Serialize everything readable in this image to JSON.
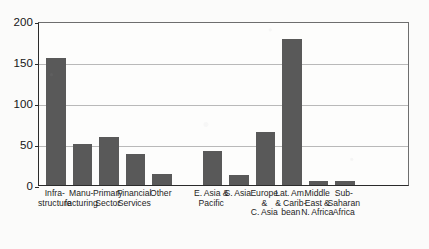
{
  "chart_data": {
    "type": "bar",
    "title": "",
    "subtitle": "",
    "xlabel": "",
    "ylabel": "",
    "ylim": [
      0,
      200
    ],
    "yticks": [
      0,
      50,
      100,
      150,
      200
    ],
    "ytick_labels": [
      "0",
      "50",
      "100",
      "150",
      "200"
    ],
    "grid": true,
    "gridlines_at": [
      50,
      100,
      150
    ],
    "legend": "none",
    "bar_color": "#595959",
    "background_color": "#fdfdfc",
    "axis_color": "#2b2b2b",
    "groups": [
      {
        "name": "sector",
        "categories": [
          "Infra-\nstructure",
          "Manu-\nfacturing",
          "Primary\nSector",
          "Financial\nServices",
          "Other"
        ],
        "values": [
          155,
          50,
          58,
          38,
          13
        ]
      },
      {
        "name": "region",
        "categories": [
          "E. Asia &\nPacific",
          "S. Asia",
          "Europe &\nC. Asia",
          "Lat. Am.\n& Carib-\nbean",
          "Middle\nEast &\nN. Africa",
          "Sub-\nSaharan\nAfrica"
        ],
        "values": [
          42,
          12,
          65,
          178,
          5,
          5
        ]
      }
    ],
    "categories": [
      "Infrastructure",
      "Manufacturing",
      "Primary Sector",
      "Financial Services",
      "Other",
      "E. Asia & Pacific",
      "S. Asia",
      "Europe & C. Asia",
      "Lat. Am. & Caribbean",
      "Middle East & N. Africa",
      "Sub-Saharan Africa"
    ],
    "values": [
      155,
      50,
      58,
      38,
      13,
      42,
      12,
      65,
      178,
      5,
      5
    ],
    "bars": [
      {
        "label_lines": [
          "Infra-",
          "structure"
        ],
        "value": 155
      },
      {
        "label_lines": [
          "Manu-",
          "facturing"
        ],
        "value": 50
      },
      {
        "label_lines": [
          "Primary",
          "Sector"
        ],
        "value": 58
      },
      {
        "label_lines": [
          "Financial",
          "Services"
        ],
        "value": 38
      },
      {
        "label_lines": [
          "Other"
        ],
        "value": 13
      },
      {
        "label_lines": [
          "E. Asia &",
          "Pacific"
        ],
        "value": 42
      },
      {
        "label_lines": [
          "S. Asia"
        ],
        "value": 12
      },
      {
        "label_lines": [
          "Europe &",
          "C. Asia"
        ],
        "value": 65
      },
      {
        "label_lines": [
          "Lat. Am.",
          "& Carib-",
          "bean"
        ],
        "value": 178
      },
      {
        "label_lines": [
          "Middle",
          "East &",
          "N. Africa"
        ],
        "value": 5
      },
      {
        "label_lines": [
          "Sub-",
          "Saharan",
          "Africa"
        ],
        "value": 5
      }
    ]
  }
}
